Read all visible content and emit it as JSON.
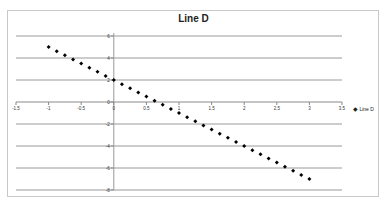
{
  "chart_data": {
    "type": "scatter",
    "title": "Line D",
    "xlabel": "",
    "ylabel": "",
    "xlim": [
      -1.5,
      3.5
    ],
    "ylim": [
      -8,
      6
    ],
    "x_ticks": [
      "-1.5",
      "-1",
      "-0.5",
      "0",
      "0.5",
      "1",
      "1.5",
      "2",
      "2.5",
      "3",
      "3.5"
    ],
    "y_ticks": [
      "6",
      "4",
      "2",
      "0",
      "-2",
      "-4",
      "-6",
      "-8"
    ],
    "grid": "horizontal",
    "legend_position": "right",
    "series": [
      {
        "name": "Line D",
        "marker": "diamond",
        "color": "#000000",
        "x": [
          -1,
          -0.875,
          -0.75,
          -0.625,
          -0.5,
          -0.375,
          -0.25,
          -0.125,
          0,
          0.125,
          0.25,
          0.375,
          0.5,
          0.625,
          0.75,
          0.875,
          1,
          1.125,
          1.25,
          1.375,
          1.5,
          1.625,
          1.75,
          1.875,
          2,
          2.125,
          2.25,
          2.375,
          2.5,
          2.625,
          2.75,
          2.875,
          3
        ],
        "y": [
          5,
          4.625,
          4.25,
          3.875,
          3.5,
          3.125,
          2.75,
          2.375,
          2,
          1.625,
          1.25,
          0.875,
          0.5,
          0.125,
          -0.25,
          -0.625,
          -1,
          -1.375,
          -1.75,
          -2.125,
          -2.5,
          -2.875,
          -3.25,
          -3.625,
          -4,
          -4.375,
          -4.75,
          -5.125,
          -5.5,
          -5.875,
          -6.25,
          -6.625,
          -7
        ]
      }
    ]
  },
  "legend": {
    "marker": "◆",
    "label": "Line D"
  }
}
